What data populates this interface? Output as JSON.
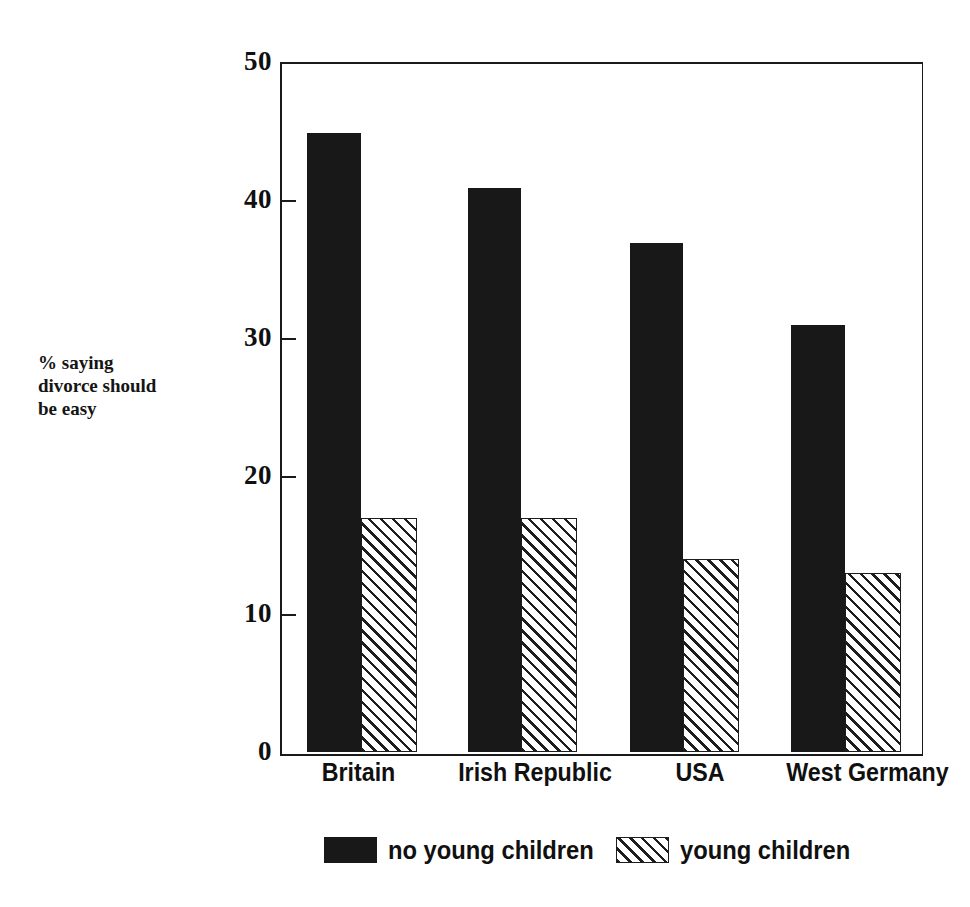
{
  "figure": {
    "ghost_title_fragment": "    ·                                    ·                              ·        ·",
    "y_axis_label_lines": [
      "% saying",
      "divorce should",
      "be easy"
    ]
  },
  "chart_data": {
    "type": "bar",
    "title": "",
    "xlabel": "",
    "ylabel": "% saying divorce should be easy",
    "categories": [
      "Britain",
      "Irish Republic",
      "USA",
      "West Germany"
    ],
    "series": [
      {
        "name": "no young children",
        "values": [
          45,
          41,
          37,
          31
        ],
        "fill": "solid-black",
        "color": "#181818"
      },
      {
        "name": "young children",
        "values": [
          17,
          17,
          14,
          13
        ],
        "fill": "diagonal-hatch",
        "color": "#1d1d1d"
      }
    ],
    "ylim": [
      0,
      50
    ],
    "ytick_labels": [
      "0",
      "10",
      "20",
      "30",
      "40",
      "50"
    ],
    "ytick_values": [
      0,
      10,
      20,
      30,
      40,
      50
    ],
    "grid": false,
    "legend_position": "bottom-center",
    "frame": "box"
  },
  "legend": {
    "entries": [
      {
        "label": "no young children",
        "swatch": "solid"
      },
      {
        "label": "young children",
        "swatch": "hatch"
      }
    ]
  }
}
